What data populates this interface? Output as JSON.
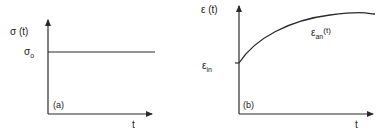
{
  "panels": [
    {
      "id": "a",
      "panel_label": "(a)",
      "y_axis_label": "σ (t)",
      "level_label_main": "σ",
      "level_label_sub": "o",
      "x_axis_label": "t",
      "curve": "constant"
    },
    {
      "id": "b",
      "panel_label": "(b)",
      "y_axis_label": "ε (t)",
      "initial_label_main": "ε",
      "initial_label_sub": "in",
      "curve_label_main": "ε",
      "curve_label_sub": "an",
      "curve_label_arg": "(t)",
      "x_axis_label": "t",
      "curve": "saturating-increase"
    }
  ],
  "colors": {
    "line": "#2a2a2a",
    "background": "#ffffff"
  }
}
